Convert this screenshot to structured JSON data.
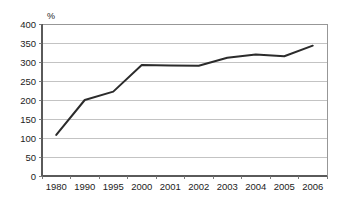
{
  "chart_data": {
    "type": "line",
    "title": "",
    "subtitle": "",
    "xlabel": "",
    "ylabel": "",
    "unit_label": "%",
    "categories": [
      "1980",
      "1990",
      "1995",
      "2000",
      "2001",
      "2002",
      "2003",
      "2004",
      "2005",
      "2006"
    ],
    "values": [
      108,
      200,
      222,
      292,
      291,
      290,
      311,
      320,
      315,
      343
    ],
    "series": [
      {
        "name": "",
        "values": [
          108,
          200,
          222,
          292,
          291,
          290,
          311,
          320,
          315,
          343
        ]
      }
    ],
    "ylim": [
      0,
      400
    ],
    "ytick_labels": [
      "0",
      "50",
      "100",
      "150",
      "200",
      "250",
      "300",
      "350",
      "400"
    ],
    "ytick_values": [
      0,
      50,
      100,
      150,
      200,
      250,
      300,
      350,
      400
    ],
    "ytick_step": 50,
    "xtick_labels": [
      "1980",
      "1990",
      "1995",
      "2000",
      "2001",
      "2002",
      "2003",
      "2004",
      "2005",
      "2006"
    ],
    "grid": "horizontal",
    "legend": "none",
    "annotations": [],
    "colors": {
      "line": "#2b2b2b",
      "gridline": "#b4b4b4",
      "axis": "#5a5a5a",
      "frame": "#8c8c8c",
      "background": "#ffffff",
      "text": "#1c1c1c"
    }
  }
}
